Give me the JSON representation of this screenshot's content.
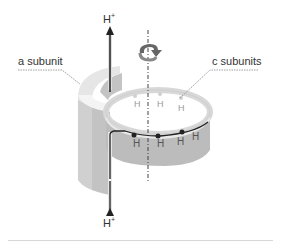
{
  "diagram": {
    "type": "ATP synthase F0 proton-translocation schematic",
    "labels": {
      "a_subunit": "a subunit",
      "c_subunits": "c subunits",
      "proton_top": "H",
      "proton_top_charge": "+",
      "proton_bottom": "H",
      "proton_bottom_charge": "+"
    },
    "ring_residue_labels_upper": [
      "H",
      "H",
      "H"
    ],
    "ring_residue_labels_lower": [
      "H",
      "H",
      "H",
      "H"
    ],
    "icons": [
      "rotation-arrow-icon",
      "proton-up-arrow-icon",
      "proton-path-arrow-icon"
    ],
    "colors": {
      "a_subunit_fill": "#d9d9d9",
      "a_subunit_shade": "#bfbfbf",
      "ring_fill": "#c8c8c8",
      "ring_top": "#f2f2f2",
      "path_line": "#222222",
      "axis": "#555555",
      "text": "#333333"
    }
  }
}
